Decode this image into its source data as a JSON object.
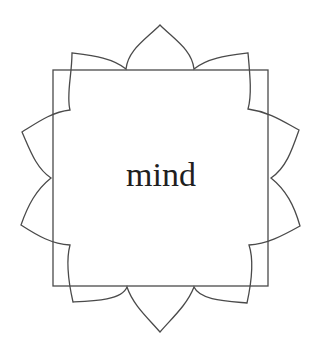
{
  "diagram": {
    "type": "lotus-square-emblem",
    "center_label": "mind",
    "shapes": [
      "square",
      "lotus-petal-outline"
    ],
    "colors": {
      "line": "#4a4a4a",
      "text": "#1f1f1f",
      "background": "#ffffff"
    }
  }
}
